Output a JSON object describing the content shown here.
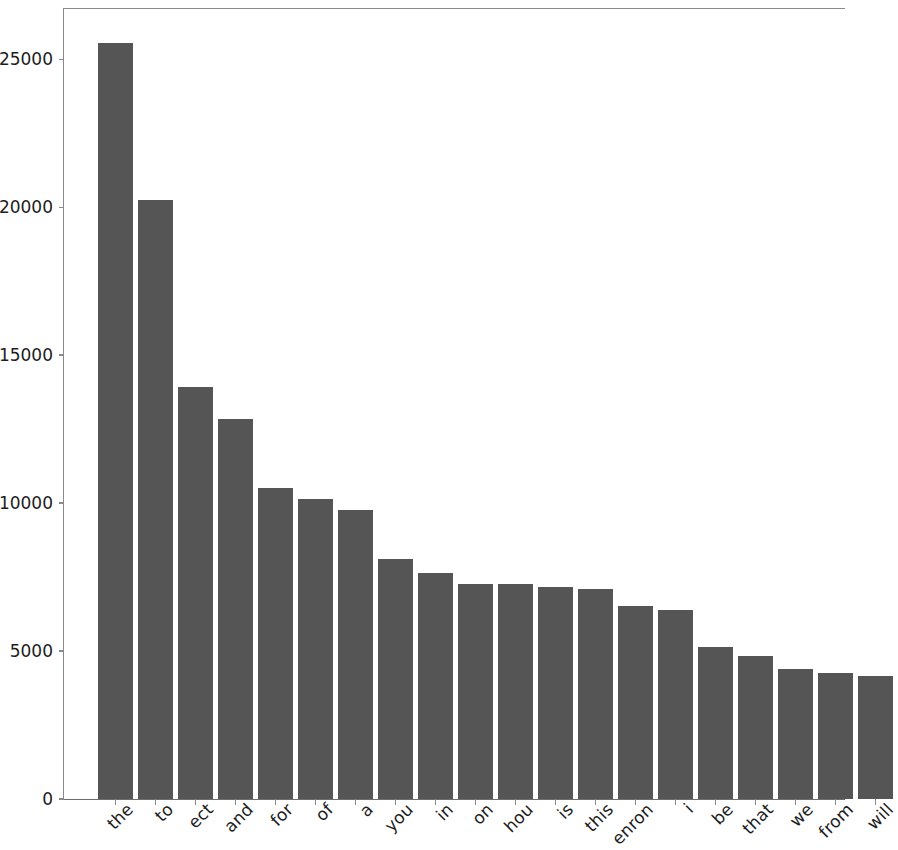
{
  "chart_data": {
    "type": "bar",
    "title": "",
    "subtitle": "",
    "xlabel": "",
    "ylabel": "",
    "categories": [
      "the",
      "to",
      "ect",
      "and",
      "for",
      "of",
      "a",
      "you",
      "in",
      "on",
      "hou",
      "is",
      "this",
      "enron",
      "i",
      "be",
      "that",
      "we",
      "from",
      "will"
    ],
    "values": [
      25540,
      20240,
      13920,
      12840,
      10510,
      10140,
      9760,
      8120,
      7640,
      7280,
      7280,
      7160,
      7100,
      6520,
      6380,
      5130,
      4830,
      4410,
      4250,
      4170
    ],
    "ylim": [
      0,
      26700
    ],
    "xlim_note": "categorical, 20 bars",
    "yticks": [
      0,
      5000,
      10000,
      15000,
      20000,
      25000
    ],
    "ytick_labels": [
      "0",
      "5000",
      "10000",
      "15000",
      "20000",
      "25000"
    ],
    "grid": false,
    "legend": null,
    "bar_color": "#555555",
    "axis_color": "#8a8a8a",
    "text_color": "#1d1d1d",
    "background": "#ffffff",
    "xtick_label_rotation": -45
  }
}
